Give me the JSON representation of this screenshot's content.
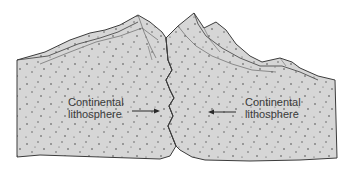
{
  "diagram": {
    "type": "continental-continental convergence cross-section",
    "labels": {
      "left": {
        "line1": "Continental",
        "line2": "lithosphere"
      },
      "right": {
        "line1": "Continental",
        "line2": "lithosphere"
      }
    },
    "arrows": {
      "left": {
        "direction": "right"
      },
      "right": {
        "direction": "left"
      }
    },
    "colors": {
      "fill": "#d6d6d6",
      "outline": "#3c3c3c",
      "dots": "#4a4a4a",
      "label_text": "#3a3a3a",
      "background": "#ffffff"
    }
  }
}
